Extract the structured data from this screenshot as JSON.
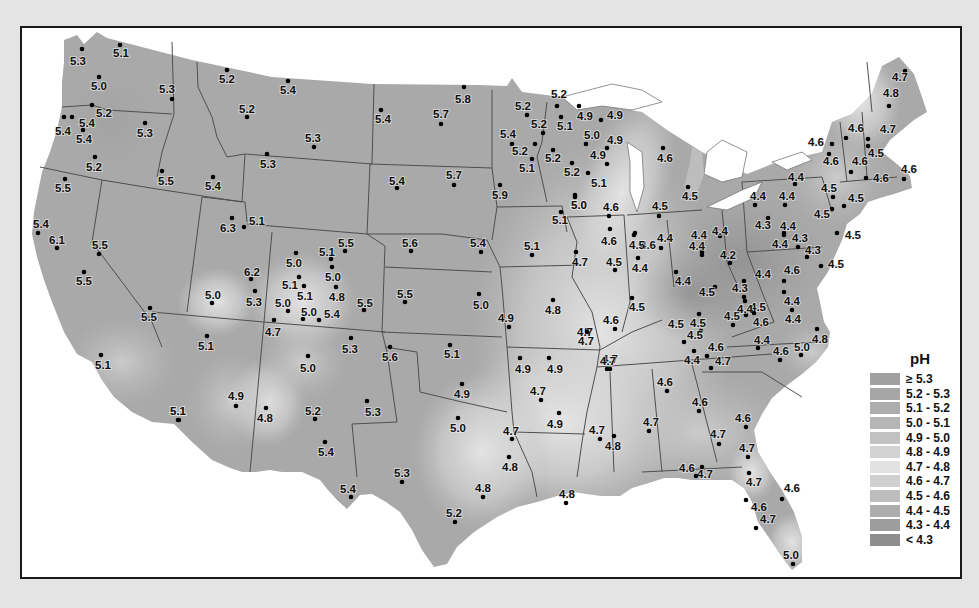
{
  "legend": {
    "title": "pH",
    "items": [
      {
        "label": "≥ 5.3",
        "color": "#a0a0a0"
      },
      {
        "label": "5.2 - 5.3",
        "color": "#a6a6a6"
      },
      {
        "label": "5.1 - 5.2",
        "color": "#adadad"
      },
      {
        "label": "5.0 - 5.1",
        "color": "#b6b6b6"
      },
      {
        "label": "4.9 - 5.0",
        "color": "#c2c2c2"
      },
      {
        "label": "4.8 - 4.9",
        "color": "#d2d2d2"
      },
      {
        "label": "4.7 - 4.8",
        "color": "#e2e2e2"
      },
      {
        "label": "4.6 - 4.7",
        "color": "#cfcfcf"
      },
      {
        "label": "4.5 - 4.6",
        "color": "#bdbdbd"
      },
      {
        "label": "4.4 - 4.5",
        "color": "#adadad"
      },
      {
        "label": "4.3 - 4.4",
        "color": "#9d9d9d"
      },
      {
        "label": "< 4.3",
        "color": "#8e8e8e"
      }
    ]
  },
  "map": {
    "land_color": "#a8a8a8",
    "border_color": "#555555",
    "water_color": "#ffffff"
  },
  "points": [
    {
      "v": "5.3",
      "x": 80,
      "y": 47,
      "lx": 68,
      "ly": 63
    },
    {
      "v": "5.1",
      "x": 118,
      "y": 43,
      "lx": 111,
      "ly": 55
    },
    {
      "v": "5.0",
      "x": 97,
      "y": 75,
      "lx": 89,
      "ly": 88
    },
    {
      "v": "5.3",
      "x": 170,
      "y": 97,
      "lx": 157,
      "ly": 91
    },
    {
      "v": "5.2",
      "x": 90,
      "y": 103,
      "lx": 94,
      "ly": 115
    },
    {
      "v": "5.4",
      "x": 62,
      "y": 115,
      "lx": 53,
      "ly": 133
    },
    {
      "v": "5.4",
      "x": 70,
      "y": 115,
      "lx": 77,
      "ly": 125
    },
    {
      "v": "5.4",
      "x": 81,
      "y": 128,
      "lx": 74,
      "ly": 141
    },
    {
      "v": "5.3",
      "x": 143,
      "y": 121,
      "lx": 135,
      "ly": 135
    },
    {
      "v": "5.2",
      "x": 93,
      "y": 155,
      "lx": 84,
      "ly": 169
    },
    {
      "v": "5.5",
      "x": 160,
      "y": 169,
      "lx": 156,
      "ly": 183
    },
    {
      "v": "5.5",
      "x": 63,
      "y": 177,
      "lx": 53,
      "ly": 190
    },
    {
      "v": "5.4",
      "x": 36,
      "y": 231,
      "lx": 31,
      "ly": 226
    },
    {
      "v": "6.1",
      "x": 55,
      "y": 246,
      "lx": 47,
      "ly": 242
    },
    {
      "v": "5.5",
      "x": 97,
      "y": 252,
      "lx": 90,
      "ly": 247
    },
    {
      "v": "5.5",
      "x": 82,
      "y": 270,
      "lx": 74,
      "ly": 283
    },
    {
      "v": "5.5",
      "x": 148,
      "y": 306,
      "lx": 139,
      "ly": 319
    },
    {
      "v": "5.1",
      "x": 99,
      "y": 353,
      "lx": 93,
      "ly": 367
    },
    {
      "v": "5.2",
      "x": 225,
      "y": 68,
      "lx": 217,
      "ly": 81
    },
    {
      "v": "5.4",
      "x": 286,
      "y": 79,
      "lx": 278,
      "ly": 92
    },
    {
      "v": "5.2",
      "x": 245,
      "y": 115,
      "lx": 237,
      "ly": 111
    },
    {
      "v": "5.3",
      "x": 312,
      "y": 145,
      "lx": 303,
      "ly": 140
    },
    {
      "v": "5.3",
      "x": 265,
      "y": 152,
      "lx": 258,
      "ly": 166
    },
    {
      "v": "5.4",
      "x": 211,
      "y": 175,
      "lx": 203,
      "ly": 188
    },
    {
      "v": "6.3",
      "x": 230,
      "y": 216,
      "lx": 218,
      "ly": 230
    },
    {
      "v": "5.1",
      "x": 242,
      "y": 225,
      "lx": 247,
      "ly": 223
    },
    {
      "v": "5.4",
      "x": 379,
      "y": 108,
      "lx": 373,
      "ly": 121
    },
    {
      "v": "5.7",
      "x": 439,
      "y": 122,
      "lx": 431,
      "ly": 116
    },
    {
      "v": "5.8",
      "x": 462,
      "y": 85,
      "lx": 453,
      "ly": 101
    },
    {
      "v": "5.4",
      "x": 395,
      "y": 186,
      "lx": 387,
      "ly": 183
    },
    {
      "v": "5.7",
      "x": 452,
      "y": 183,
      "lx": 444,
      "ly": 177
    },
    {
      "v": "5.9",
      "x": 498,
      "y": 183,
      "lx": 490,
      "ly": 197
    },
    {
      "v": "5.0",
      "x": 294,
      "y": 251,
      "lx": 284,
      "ly": 265
    },
    {
      "v": "5.1",
      "x": 329,
      "y": 257,
      "lx": 317,
      "ly": 254
    },
    {
      "v": "5.5",
      "x": 343,
      "y": 249,
      "lx": 336,
      "ly": 245
    },
    {
      "v": "5.0",
      "x": 330,
      "y": 265,
      "lx": 323,
      "ly": 279
    },
    {
      "v": "6.2",
      "x": 249,
      "y": 277,
      "lx": 242,
      "ly": 274
    },
    {
      "v": "5.1",
      "x": 297,
      "y": 275,
      "lx": 280,
      "ly": 287
    },
    {
      "v": "5.1",
      "x": 302,
      "y": 284,
      "lx": 295,
      "ly": 298
    },
    {
      "v": "4.8",
      "x": 334,
      "y": 285,
      "lx": 327,
      "ly": 299
    },
    {
      "v": "5.0",
      "x": 210,
      "y": 301,
      "lx": 203,
      "ly": 297
    },
    {
      "v": "5.3",
      "x": 253,
      "y": 289,
      "lx": 244,
      "ly": 304
    },
    {
      "v": "5.0",
      "x": 286,
      "y": 309,
      "lx": 273,
      "ly": 305
    },
    {
      "v": "5.0",
      "x": 301,
      "y": 317,
      "lx": 299,
      "ly": 314
    },
    {
      "v": "5.4",
      "x": 317,
      "y": 318,
      "lx": 322,
      "ly": 316
    },
    {
      "v": "5.5",
      "x": 362,
      "y": 308,
      "lx": 355,
      "ly": 305
    },
    {
      "v": "4.7",
      "x": 272,
      "y": 318,
      "lx": 263,
      "ly": 334
    },
    {
      "v": "5.1",
      "x": 205,
      "y": 334,
      "lx": 196,
      "ly": 348
    },
    {
      "v": "5.3",
      "x": 349,
      "y": 336,
      "lx": 340,
      "ly": 351
    },
    {
      "v": "5.0",
      "x": 306,
      "y": 354,
      "lx": 298,
      "ly": 370
    },
    {
      "v": "4.9",
      "x": 234,
      "y": 404,
      "lx": 226,
      "ly": 398
    },
    {
      "v": "4.8",
      "x": 264,
      "y": 406,
      "lx": 255,
      "ly": 420
    },
    {
      "v": "5.1",
      "x": 177,
      "y": 418,
      "lx": 168,
      "ly": 413
    },
    {
      "v": "5.2",
      "x": 313,
      "y": 417,
      "lx": 303,
      "ly": 413
    },
    {
      "v": "5.4",
      "x": 323,
      "y": 440,
      "lx": 316,
      "ly": 454
    },
    {
      "v": "5.3",
      "x": 365,
      "y": 399,
      "lx": 363,
      "ly": 414
    },
    {
      "v": "5.4",
      "x": 349,
      "y": 495,
      "lx": 338,
      "ly": 491
    },
    {
      "v": "5.6",
      "x": 388,
      "y": 345,
      "lx": 380,
      "ly": 359
    },
    {
      "v": "5.6",
      "x": 409,
      "y": 249,
      "lx": 400,
      "ly": 245
    },
    {
      "v": "5.5",
      "x": 403,
      "y": 300,
      "lx": 395,
      "ly": 296
    },
    {
      "v": "5.4",
      "x": 479,
      "y": 250,
      "lx": 468,
      "ly": 245
    },
    {
      "v": "5.0",
      "x": 477,
      "y": 292,
      "lx": 471,
      "ly": 307
    },
    {
      "v": "4.9",
      "x": 507,
      "y": 325,
      "lx": 496,
      "ly": 320
    },
    {
      "v": "5.1",
      "x": 448,
      "y": 343,
      "lx": 442,
      "ly": 356
    },
    {
      "v": "4.9",
      "x": 460,
      "y": 382,
      "lx": 452,
      "ly": 396
    },
    {
      "v": "5.0",
      "x": 456,
      "y": 416,
      "lx": 448,
      "ly": 430
    },
    {
      "v": "5.3",
      "x": 400,
      "y": 480,
      "lx": 392,
      "ly": 475
    },
    {
      "v": "5.2",
      "x": 453,
      "y": 520,
      "lx": 444,
      "ly": 515
    },
    {
      "v": "4.8",
      "x": 481,
      "y": 495,
      "lx": 473,
      "ly": 490
    },
    {
      "v": "4.7",
      "x": 510,
      "y": 437,
      "lx": 501,
      "ly": 433
    },
    {
      "v": "4.8",
      "x": 507,
      "y": 455,
      "lx": 500,
      "ly": 469
    },
    {
      "v": "5.2",
      "x": 555,
      "y": 104,
      "lx": 549,
      "ly": 96
    },
    {
      "v": "5.2",
      "x": 525,
      "y": 113,
      "lx": 513,
      "ly": 108
    },
    {
      "v": "4.9",
      "x": 577,
      "y": 104,
      "lx": 575,
      "ly": 118
    },
    {
      "v": "5.1",
      "x": 559,
      "y": 115,
      "lx": 555,
      "ly": 128
    },
    {
      "v": "5.2",
      "x": 541,
      "y": 131,
      "lx": 529,
      "ly": 126
    },
    {
      "v": "4.9",
      "x": 599,
      "y": 118,
      "lx": 605,
      "ly": 117
    },
    {
      "v": "5.4",
      "x": 510,
      "y": 142,
      "lx": 498,
      "ly": 136
    },
    {
      "v": "5.2",
      "x": 533,
      "y": 142,
      "lx": 510,
      "ly": 153
    },
    {
      "v": "5.0",
      "x": 584,
      "y": 142,
      "lx": 582,
      "ly": 137
    },
    {
      "v": "4.9",
      "x": 605,
      "y": 146,
      "lx": 605,
      "ly": 142
    },
    {
      "v": "5.1",
      "x": 530,
      "y": 157,
      "lx": 517,
      "ly": 170
    },
    {
      "v": "5.2",
      "x": 551,
      "y": 148,
      "lx": 543,
      "ly": 160
    },
    {
      "v": "4.9",
      "x": 605,
      "y": 162,
      "lx": 588,
      "ly": 157
    },
    {
      "v": "5.2",
      "x": 570,
      "y": 161,
      "lx": 562,
      "ly": 174
    },
    {
      "v": "5.1",
      "x": 586,
      "y": 171,
      "lx": 589,
      "ly": 185
    },
    {
      "v": "5.0",
      "x": 573,
      "y": 193,
      "lx": 569,
      "ly": 207
    },
    {
      "v": "4.6",
      "x": 661,
      "y": 146,
      "lx": 655,
      "ly": 160
    },
    {
      "v": "4.5",
      "x": 686,
      "y": 185,
      "lx": 680,
      "ly": 198
    },
    {
      "v": "4.6",
      "x": 607,
      "y": 214,
      "lx": 601,
      "ly": 209
    },
    {
      "v": "4.5",
      "x": 657,
      "y": 214,
      "lx": 650,
      "ly": 208
    },
    {
      "v": "5.1",
      "x": 559,
      "y": 210,
      "lx": 550,
      "ly": 222
    },
    {
      "v": "5.1",
      "x": 530,
      "y": 253,
      "lx": 522,
      "ly": 248
    },
    {
      "v": "5.0",
      "x": 573,
      "y": 195,
      "lx": 569,
      "ly": 207
    },
    {
      "v": "4.6",
      "x": 608,
      "y": 227,
      "lx": 599,
      "ly": 243
    },
    {
      "v": "4.6",
      "x": 633,
      "y": 231,
      "lx": 638,
      "ly": 247
    },
    {
      "v": "4.7",
      "x": 574,
      "y": 250,
      "lx": 570,
      "ly": 264
    },
    {
      "v": "4.5",
      "x": 613,
      "y": 268,
      "lx": 604,
      "ly": 264
    },
    {
      "v": "4.5",
      "x": 632,
      "y": 233,
      "lx": 627,
      "ly": 247
    },
    {
      "v": "4.4",
      "x": 636,
      "y": 256,
      "lx": 630,
      "ly": 270
    },
    {
      "v": "4.4",
      "x": 659,
      "y": 246,
      "lx": 655,
      "ly": 240
    },
    {
      "v": "4.8",
      "x": 551,
      "y": 298,
      "lx": 543,
      "ly": 312
    },
    {
      "v": "4.7",
      "x": 585,
      "y": 328,
      "lx": 575,
      "ly": 334
    },
    {
      "v": "4.6",
      "x": 613,
      "y": 327,
      "lx": 601,
      "ly": 322
    },
    {
      "v": "4.5",
      "x": 630,
      "y": 296,
      "lx": 627,
      "ly": 309
    },
    {
      "v": "4.4",
      "x": 674,
      "y": 270,
      "lx": 673,
      "ly": 283
    },
    {
      "v": "4.4",
      "x": 700,
      "y": 250,
      "lx": 689,
      "ly": 237
    },
    {
      "v": "4.4",
      "x": 700,
      "y": 253,
      "lx": 687,
      "ly": 248
    },
    {
      "v": "4.4",
      "x": 718,
      "y": 234,
      "lx": 710,
      "ly": 233
    },
    {
      "v": "4.2",
      "x": 728,
      "y": 261,
      "lx": 718,
      "ly": 257
    },
    {
      "v": "4.4",
      "x": 753,
      "y": 203,
      "lx": 748,
      "ly": 198
    },
    {
      "v": "4.4",
      "x": 783,
      "y": 203,
      "lx": 777,
      "ly": 198
    },
    {
      "v": "4.4",
      "x": 793,
      "y": 182,
      "lx": 786,
      "ly": 179
    },
    {
      "v": "4.3",
      "x": 766,
      "y": 216,
      "lx": 753,
      "ly": 227
    },
    {
      "v": "4.4",
      "x": 782,
      "y": 231,
      "lx": 778,
      "ly": 228
    },
    {
      "v": "4.4",
      "x": 782,
      "y": 233,
      "lx": 770,
      "ly": 246
    },
    {
      "v": "4.3",
      "x": 796,
      "y": 245,
      "lx": 790,
      "ly": 240
    },
    {
      "v": "4.3",
      "x": 805,
      "y": 255,
      "lx": 803,
      "ly": 252
    },
    {
      "v": "4.5",
      "x": 830,
      "y": 207,
      "lx": 812,
      "ly": 216
    },
    {
      "v": "4.5",
      "x": 835,
      "y": 231,
      "lx": 843,
      "ly": 237
    },
    {
      "v": "4.5",
      "x": 819,
      "y": 264,
      "lx": 826,
      "ly": 266
    },
    {
      "v": "4.5",
      "x": 831,
      "y": 195,
      "lx": 819,
      "ly": 190
    },
    {
      "v": "4.5",
      "x": 842,
      "y": 204,
      "lx": 846,
      "ly": 200
    },
    {
      "v": "4.6",
      "x": 830,
      "y": 142,
      "lx": 806,
      "ly": 144
    },
    {
      "v": "4.6",
      "x": 827,
      "y": 152,
      "lx": 821,
      "ly": 163
    },
    {
      "v": "4.6",
      "x": 849,
      "y": 170,
      "lx": 850,
      "ly": 163
    },
    {
      "v": "4.6",
      "x": 864,
      "y": 176,
      "lx": 871,
      "ly": 180
    },
    {
      "v": "4.6",
      "x": 844,
      "y": 136,
      "lx": 846,
      "ly": 130
    },
    {
      "v": "4.7",
      "x": 866,
      "y": 137,
      "lx": 878,
      "ly": 131
    },
    {
      "v": "4.5",
      "x": 866,
      "y": 144,
      "lx": 866,
      "ly": 155
    },
    {
      "v": "4.7",
      "x": 903,
      "y": 69,
      "lx": 890,
      "ly": 79
    },
    {
      "v": "4.8",
      "x": 887,
      "y": 104,
      "lx": 881,
      "ly": 95
    },
    {
      "v": "4.6",
      "x": 902,
      "y": 177,
      "lx": 899,
      "ly": 171
    },
    {
      "v": "4.5",
      "x": 713,
      "y": 285,
      "lx": 697,
      "ly": 294
    },
    {
      "v": "4.5",
      "x": 731,
      "y": 323,
      "lx": 722,
      "ly": 318
    },
    {
      "v": "4.5",
      "x": 699,
      "y": 329,
      "lx": 666,
      "ly": 326
    },
    {
      "v": "4.5",
      "x": 682,
      "y": 340,
      "lx": 685,
      "ly": 337
    },
    {
      "v": "4.5",
      "x": 744,
      "y": 313,
      "lx": 748,
      "ly": 309
    },
    {
      "v": "4.4",
      "x": 742,
      "y": 279,
      "lx": 753,
      "ly": 276
    },
    {
      "v": "4.3",
      "x": 742,
      "y": 295,
      "lx": 730,
      "ly": 290
    },
    {
      "v": "4.4",
      "x": 743,
      "y": 299,
      "lx": 735,
      "ly": 311
    },
    {
      "v": "4.6",
      "x": 752,
      "y": 311,
      "lx": 751,
      "ly": 324
    },
    {
      "v": "4.6",
      "x": 782,
      "y": 279,
      "lx": 782,
      "ly": 272
    },
    {
      "v": "4.4",
      "x": 782,
      "y": 290,
      "lx": 782,
      "ly": 303
    },
    {
      "v": "4.4",
      "x": 790,
      "y": 308,
      "lx": 783,
      "ly": 321
    },
    {
      "v": "4.5",
      "x": 697,
      "y": 312,
      "lx": 688,
      "ly": 325
    },
    {
      "v": "4.4",
      "x": 692,
      "y": 349,
      "lx": 682,
      "ly": 362
    },
    {
      "v": "4.6",
      "x": 705,
      "y": 354,
      "lx": 706,
      "ly": 349
    },
    {
      "v": "4.7",
      "x": 709,
      "y": 366,
      "lx": 713,
      "ly": 363
    },
    {
      "v": "4.4",
      "x": 756,
      "y": 346,
      "lx": 752,
      "ly": 342
    },
    {
      "v": "4.6",
      "x": 778,
      "y": 358,
      "lx": 771,
      "ly": 353
    },
    {
      "v": "5.0",
      "x": 799,
      "y": 353,
      "lx": 792,
      "ly": 349
    },
    {
      "v": "4.8",
      "x": 815,
      "y": 327,
      "lx": 810,
      "ly": 341
    },
    {
      "v": "4.7",
      "x": 585,
      "y": 330,
      "lx": 576,
      "ly": 343
    },
    {
      "v": "4.7",
      "x": 608,
      "y": 367,
      "lx": 600,
      "ly": 361
    },
    {
      "v": "4.9",
      "x": 518,
      "y": 356,
      "lx": 513,
      "ly": 371
    },
    {
      "v": "4.9",
      "x": 547,
      "y": 356,
      "lx": 545,
      "ly": 371
    },
    {
      "v": "4.7",
      "x": 539,
      "y": 398,
      "lx": 528,
      "ly": 393
    },
    {
      "v": "4.9",
      "x": 557,
      "y": 411,
      "lx": 545,
      "ly": 426
    },
    {
      "v": "4.7",
      "x": 598,
      "y": 437,
      "lx": 587,
      "ly": 432
    },
    {
      "v": "4.8",
      "x": 612,
      "y": 434,
      "lx": 603,
      "ly": 448
    },
    {
      "v": "4.7",
      "x": 605,
      "y": 367,
      "lx": 598,
      "ly": 363
    },
    {
      "v": "4.6",
      "x": 665,
      "y": 389,
      "lx": 655,
      "ly": 384
    },
    {
      "v": "4.7",
      "x": 647,
      "y": 429,
      "lx": 641,
      "ly": 424
    },
    {
      "v": "4.6",
      "x": 697,
      "y": 409,
      "lx": 690,
      "ly": 404
    },
    {
      "v": "4.6",
      "x": 744,
      "y": 425,
      "lx": 733,
      "ly": 420
    },
    {
      "v": "4.7",
      "x": 717,
      "y": 442,
      "lx": 708,
      "ly": 436
    },
    {
      "v": "4.7",
      "x": 746,
      "y": 455,
      "lx": 737,
      "ly": 450
    },
    {
      "v": "4.7",
      "x": 700,
      "y": 465,
      "lx": 695,
      "ly": 476
    },
    {
      "v": "4.6",
      "x": 694,
      "y": 474,
      "lx": 677,
      "ly": 470
    },
    {
      "v": "4.7",
      "x": 747,
      "y": 471,
      "lx": 744,
      "ly": 484
    },
    {
      "v": "4.6",
      "x": 780,
      "y": 497,
      "lx": 782,
      "ly": 490
    },
    {
      "v": "4.6",
      "x": 744,
      "y": 498,
      "lx": 749,
      "ly": 509
    },
    {
      "v": "4.7",
      "x": 754,
      "y": 526,
      "lx": 758,
      "ly": 521
    },
    {
      "v": "5.0",
      "x": 791,
      "y": 562,
      "lx": 781,
      "ly": 557
    },
    {
      "v": "4.8",
      "x": 564,
      "y": 501,
      "lx": 557,
      "ly": 496
    },
    {
      "v": "5.1",
      "x": 176,
      "y": 418,
      "lx": 168,
      "ly": 413
    }
  ]
}
